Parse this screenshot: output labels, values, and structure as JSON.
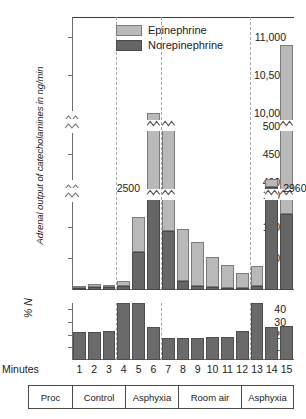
{
  "figure": {
    "y_axis_title": "Adrenal output of catecholamines in ng/min",
    "lower_axis_title": "% N",
    "minutes_row_label": "Minutes",
    "proc_row_label": "Proc"
  },
  "legend": {
    "items": [
      {
        "label": "Epinephrine",
        "color": "#b9b9b9",
        "name": "legend-epinephrine"
      },
      {
        "label": "Norepinephrine",
        "color": "#666666",
        "name": "legend-norepinephrine"
      }
    ]
  },
  "annotations": {
    "break_2500": "2500",
    "break_2960": "2960"
  },
  "axis_labels": {
    "y_main": [
      "11,000",
      "10,500",
      "10,000",
      "5000",
      "4500",
      "4000",
      "1500",
      "1000",
      "500"
    ],
    "y_percent": [
      "40",
      "30",
      "20",
      "10"
    ]
  },
  "procedures": [
    {
      "label": "Proc",
      "span_start": 0,
      "span_end": 0
    },
    {
      "label": "Control",
      "span_start": 1,
      "span_end": 3
    },
    {
      "label": "Asphyxia",
      "span_start": 4,
      "span_end": 6
    },
    {
      "label": "Room air",
      "span_start": 7,
      "span_end": 12
    },
    {
      "label": "Asphyxia",
      "span_start": 13,
      "span_end": 15
    }
  ],
  "chart_data": {
    "type": "bar",
    "title": "",
    "xlabel": "Minutes",
    "ylabel": "Adrenal output of catecholamines in ng/min",
    "stacked": true,
    "axis_breaks": [
      {
        "between": [
          4000,
          4500
        ],
        "note": "axis break between 1500 and 4000 region"
      },
      {
        "between": [
          5000,
          10000
        ],
        "note": "axis break between 5000 and 10,000 region"
      }
    ],
    "ylim": [
      0,
      11000
    ],
    "yticks": [
      500,
      1000,
      1500,
      4000,
      4500,
      5000,
      10000,
      10500,
      11000
    ],
    "grid": false,
    "legend_position": "top-center",
    "categories": [
      "1",
      "2",
      "3",
      "4",
      "5",
      "6",
      "7",
      "8",
      "9",
      "10",
      "11",
      "12",
      "13",
      "14",
      "15"
    ],
    "series": [
      {
        "name": "Norepinephrine",
        "color": "#666666",
        "values": [
          30,
          45,
          40,
          60,
          600,
          2500,
          930,
          150,
          60,
          40,
          35,
          30,
          60,
          2960,
          1200
        ]
      },
      {
        "name": "Epinephrine",
        "color": "#b9b9b9",
        "values": [
          40,
          50,
          45,
          90,
          560,
          7480,
          4170,
          820,
          700,
          480,
          365,
          240,
          320,
          1090,
          9700
        ]
      }
    ],
    "totals": [
      70,
      95,
      85,
      150,
      1160,
      9980,
      5100,
      970,
      760,
      520,
      400,
      270,
      380,
      4050,
      10900
    ],
    "secondary_chart": {
      "type": "bar",
      "ylabel": "% N",
      "ylim": [
        0,
        45
      ],
      "yticks": [
        10,
        20,
        30,
        40
      ],
      "categories": [
        "1",
        "2",
        "3",
        "4",
        "5",
        "6",
        "7",
        "8",
        "9",
        "10",
        "11",
        "12",
        "13",
        "14",
        "15"
      ],
      "values": [
        22,
        22,
        23,
        45,
        45,
        26,
        17,
        17,
        17,
        18,
        18,
        23,
        45,
        26,
        27
      ],
      "clipped_indices": [
        3,
        4,
        12
      ],
      "note": "bars at minutes 4, 5 and 13 exceed the plotted range"
    }
  }
}
